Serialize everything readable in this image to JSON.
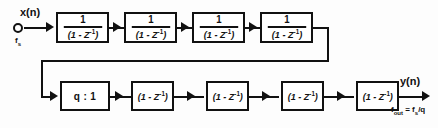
{
  "diagram": {
    "input": {
      "signal_label": "x(n)",
      "rate_label_prefix": "f",
      "rate_label_sub": "s",
      "node_icon": "input-node-circle"
    },
    "output": {
      "signal_label": "y(n)",
      "rate_text_a": "f",
      "rate_text_a_sub": "out",
      "rate_text_b": " = f",
      "rate_text_b_sub": "s",
      "rate_text_c": "/q"
    },
    "integrator_stage": {
      "count": 4,
      "numerator": "1",
      "denominator_open": "(1 - Z",
      "denominator_sup": "-1",
      "denominator_close": ")"
    },
    "decimator": {
      "label": "q : 1"
    },
    "comb_stage": {
      "count": 4,
      "open": "(1 - Z",
      "sup": "-1",
      "close": ")"
    },
    "colors": {
      "ink": "#111111",
      "background": "#fdfdfd",
      "box_fill": "#ffffff"
    }
  }
}
